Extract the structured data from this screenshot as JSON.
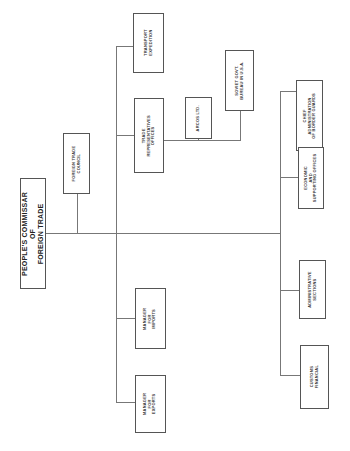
{
  "diagram": {
    "type": "org-chart",
    "orientation": "rotated-90-ccw",
    "root": {
      "id": "commissar",
      "label": "PEOPLE'S COMMISSAR\nOF\nFOREIGN TRADE"
    },
    "nodes": [
      {
        "id": "foreign_trade_council",
        "label": "FOREIGN TRADE\nCOUNCIL"
      },
      {
        "id": "transport_expedition",
        "label": "TRANSPORT\nEXPEDITION"
      },
      {
        "id": "trade_representatives",
        "label": "TRADE\nREPRESENTATIVES\nOFFICES"
      },
      {
        "id": "arcos",
        "label": "ARCOS LTD."
      },
      {
        "id": "soviet_govt_bureau",
        "label": "SOVIET GOVT.\nBUREAU IN U.S.A."
      },
      {
        "id": "border_guards",
        "label": "CHIEF\nADMINISTRATION\nOF BORDER GUARDS"
      },
      {
        "id": "economic_offices",
        "label": "ECONOMIC\nAND\nSUPPORTING OFFICES"
      },
      {
        "id": "administrative_sections",
        "label": "ADMINISTRATIVE\nSECTIONS"
      },
      {
        "id": "customs_financial",
        "label": "CUSTOMS\nFINANCIAL"
      },
      {
        "id": "manager_imports",
        "label": "MANAGER\nFOR\nIMPORTS"
      },
      {
        "id": "manager_exports",
        "label": "MANAGER\nFOR\nEXPORTS"
      }
    ],
    "edges": [
      [
        "commissar",
        "foreign_trade_council"
      ],
      [
        "commissar",
        "transport_expedition"
      ],
      [
        "commissar",
        "trade_representatives"
      ],
      [
        "trade_representatives",
        "arcos"
      ],
      [
        "trade_representatives",
        "soviet_govt_bureau"
      ],
      [
        "commissar",
        "manager_imports"
      ],
      [
        "commissar",
        "manager_exports"
      ],
      [
        "commissar",
        "border_guards"
      ],
      [
        "commissar",
        "economic_offices"
      ],
      [
        "commissar",
        "administrative_sections"
      ],
      [
        "commissar",
        "customs_financial"
      ]
    ],
    "colors": {
      "line": "#777777",
      "border": "#555555",
      "text": "#333333",
      "background": "#ffffff"
    }
  }
}
